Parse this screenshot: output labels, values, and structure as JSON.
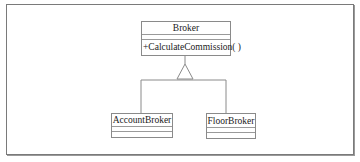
{
  "diagram": {
    "type": "uml-class-inheritance",
    "classes": [
      {
        "id": "broker",
        "name": "Broker",
        "attributes": [],
        "operations": [
          "+CalculateCommission( )"
        ]
      },
      {
        "id": "account-broker",
        "name": "AccountBroker",
        "attributes": [],
        "operations": []
      },
      {
        "id": "floor-broker",
        "name": "FloorBroker",
        "attributes": [],
        "operations": []
      }
    ],
    "relationships": [
      {
        "type": "generalization",
        "from": "AccountBroker",
        "to": "Broker"
      },
      {
        "type": "generalization",
        "from": "FloorBroker",
        "to": "Broker"
      }
    ],
    "colors": {
      "line": "#8a8a8a",
      "frame": "#7a7a7a",
      "text": "#222222"
    }
  }
}
